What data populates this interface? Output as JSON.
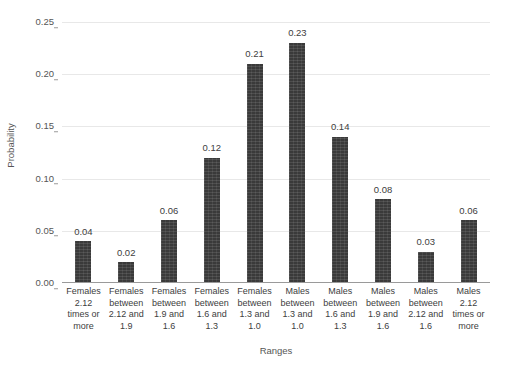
{
  "chart_data": {
    "type": "bar",
    "title": "",
    "xlabel": "Ranges",
    "ylabel": "Probability",
    "ylim": [
      0,
      0.25
    ],
    "ytick_labels": [
      "0.00",
      "0.05",
      "0.10",
      "0.15",
      "0.20",
      "0.25"
    ],
    "ytick_values": [
      0,
      0.05,
      0.1,
      0.15,
      0.2,
      0.25
    ],
    "grid": true,
    "legend": "none",
    "bar_color": "#3a3a3a",
    "categories": [
      "Females 2.12 times or more",
      "Females between 2.12 and 1.9",
      "Females between 1.9 and 1.6",
      "Females between 1.6 and 1.3",
      "Females between 1.3 and 1.0",
      "Males between 1.3 and 1.0",
      "Males between 1.6 and 1.3",
      "Males between 1.9 and 1.6",
      "Males between 2.12 and 1.6",
      "Males 2.12 times or more"
    ],
    "category_lines": [
      [
        "Females",
        "2.12",
        "times or",
        "more"
      ],
      [
        "Females",
        "between",
        "2.12 and",
        "1.9"
      ],
      [
        "Females",
        "between",
        "1.9 and",
        "1.6"
      ],
      [
        "Females",
        "between",
        "1.6 and",
        "1.3"
      ],
      [
        "Females",
        "between",
        "1.3 and",
        "1.0"
      ],
      [
        "Males",
        "between",
        "1.3 and",
        "1.0"
      ],
      [
        "Males",
        "between",
        "1.6 and",
        "1.3"
      ],
      [
        "Males",
        "between",
        "1.9 and",
        "1.6"
      ],
      [
        "Males",
        "between",
        "2.12 and",
        "1.6"
      ],
      [
        "Males",
        "2.12",
        "times or",
        "more"
      ]
    ],
    "values": [
      0.04,
      0.02,
      0.06,
      0.12,
      0.21,
      0.23,
      0.14,
      0.08,
      0.03,
      0.06
    ],
    "value_labels": [
      "0.04",
      "0.02",
      "0.06",
      "0.12",
      "0.21",
      "0.23",
      "0.14",
      "0.08",
      "0.03",
      "0.06"
    ]
  }
}
